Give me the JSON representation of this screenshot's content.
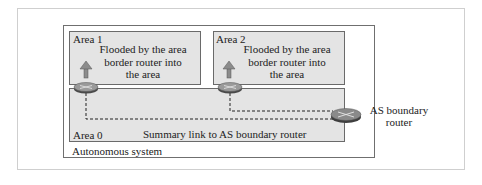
{
  "diagram": {
    "outer_label": "Autonomous system",
    "areas": [
      {
        "name": "Area 1",
        "note": [
          "Flooded by the area",
          "border router into",
          "the area"
        ]
      },
      {
        "name": "Area 2",
        "note": [
          "Flooded by the area",
          "border router into",
          "the area"
        ]
      },
      {
        "name": "Area 0",
        "link_label": "Summary link to AS boundary router"
      }
    ],
    "as_boundary_router_label": [
      "AS boundary",
      "router"
    ],
    "colors": {
      "area_fill": "#e4e4e4",
      "router_fill": "#8a8a8a",
      "arrow_fill": "#8c8c8c"
    }
  }
}
